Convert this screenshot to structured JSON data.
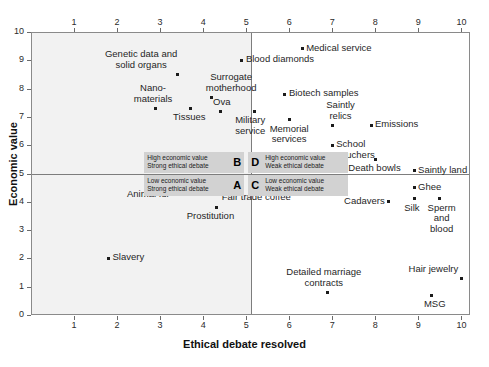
{
  "chart_data": {
    "type": "scatter",
    "title": "",
    "xlabel": "Ethical debate resolved",
    "ylabel": "Economic value",
    "xlim": [
      0,
      10.2
    ],
    "ylim": [
      0,
      10
    ],
    "xticks": [
      1,
      2,
      3,
      4,
      5,
      6,
      7,
      8,
      9,
      10
    ],
    "yticks": [
      1,
      2,
      3,
      4,
      5,
      6,
      7,
      8,
      9,
      10
    ],
    "xticks_top": [
      1,
      2,
      3,
      4,
      5,
      6,
      7,
      8,
      9,
      10
    ],
    "grid": false,
    "legend": "none",
    "dividers": {
      "x": 5,
      "y": 5
    },
    "shaded_region": "x < 5",
    "points": [
      {
        "label": "Medical service",
        "x": 6.3,
        "y": 9.4,
        "pos": "right"
      },
      {
        "label": "Blood diamonds",
        "x": 4.9,
        "y": 9.0,
        "pos": "right"
      },
      {
        "label": "Genetic data and\nsolid organs",
        "x": 3.4,
        "y": 8.5,
        "pos": "above-left"
      },
      {
        "label": "Surrogate\nmotherhood",
        "x": 4.2,
        "y": 7.7,
        "pos": "above-right"
      },
      {
        "label": "Nano-\nmaterials",
        "x": 2.9,
        "y": 7.3,
        "pos": "above"
      },
      {
        "label": "Ova",
        "x": 4.4,
        "y": 7.2,
        "pos": "above"
      },
      {
        "label": "Tissues",
        "x": 3.7,
        "y": 7.3,
        "pos": "below"
      },
      {
        "label": "Biotech samples",
        "x": 5.9,
        "y": 7.8,
        "pos": "right"
      },
      {
        "label": "Military\nservice",
        "x": 5.2,
        "y": 7.2,
        "pos": "below"
      },
      {
        "label": "Memorial\nservices",
        "x": 6.0,
        "y": 6.9,
        "pos": "below"
      },
      {
        "label": "Saintly\nrelics",
        "x": 7.0,
        "y": 6.7,
        "pos": "above-right"
      },
      {
        "label": "Emissions",
        "x": 7.9,
        "y": 6.7,
        "pos": "right"
      },
      {
        "label": "School\nvouchers",
        "x": 7.0,
        "y": 6.0,
        "pos": "right"
      },
      {
        "label": "Death bowls",
        "x": 8.0,
        "y": 5.5,
        "pos": "below"
      },
      {
        "label": "Saintly land",
        "x": 8.9,
        "y": 5.1,
        "pos": "right"
      },
      {
        "label": "Animal fur",
        "x": 2.8,
        "y": 4.6,
        "pos": "below"
      },
      {
        "label": "Prostitution",
        "x": 4.3,
        "y": 3.8,
        "pos": "below"
      },
      {
        "label": "Slavery",
        "x": 1.8,
        "y": 2.0,
        "pos": "right"
      },
      {
        "label": "Fair trade coffee",
        "x": 5.4,
        "y": 4.5,
        "pos": "below"
      },
      {
        "label": "Ghee",
        "x": 8.9,
        "y": 4.5,
        "pos": "right"
      },
      {
        "label": "Cadavers",
        "x": 8.3,
        "y": 4.0,
        "pos": "left"
      },
      {
        "label": "Silk",
        "x": 8.9,
        "y": 4.1,
        "pos": "below"
      },
      {
        "label": "Sperm\nand\nblood",
        "x": 9.5,
        "y": 4.1,
        "pos": "below"
      },
      {
        "label": "Detailed marriage\ncontracts",
        "x": 6.9,
        "y": 0.8,
        "pos": "above"
      },
      {
        "label": "Hair jewelry",
        "x": 10.0,
        "y": 1.3,
        "pos": "above-left"
      },
      {
        "label": "MSG",
        "x": 9.3,
        "y": 0.7,
        "pos": "below"
      }
    ],
    "quadrant_legend": [
      {
        "letter": "B",
        "line1": "High economic value",
        "line2": "Strong ethical debate"
      },
      {
        "letter": "D",
        "line1": "High economic value",
        "line2": "Weak ethical debate"
      },
      {
        "letter": "A",
        "line1": "Low economic value",
        "line2": "Strong ethical debate"
      },
      {
        "letter": "C",
        "line1": "Low economic value",
        "line2": "Weak ethical debate"
      }
    ],
    "colors": {
      "point": "#1c1c1c",
      "shade": "#f2f2f2",
      "frame": "#8a8a8a",
      "legend_box": "#d2d2d2"
    }
  }
}
